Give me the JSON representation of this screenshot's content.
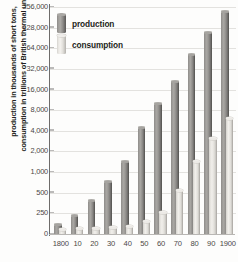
{
  "chart_data": {
    "type": "bar",
    "title": "",
    "xlabel": "",
    "ylabel": "production in thousands of short tons, consumption in trillions of British thermal units",
    "ylabel_lines": [
      "production in thousands of short tons,",
      "consumption in trillions of British thermal units"
    ],
    "yscale": "log2",
    "ylim": [
      0,
      256000
    ],
    "ytick_labels": [
      "256,000",
      "128,000",
      "64,000",
      "32,000",
      "16,000",
      "8,000",
      "4,000",
      "2,000",
      "1,000",
      "500",
      "250",
      "0"
    ],
    "ytick_values": [
      256000,
      128000,
      64000,
      32000,
      16000,
      8000,
      4000,
      2000,
      1000,
      500,
      250,
      0
    ],
    "grid": true,
    "legend_position": "top-left",
    "categories": [
      "1800",
      "10",
      "20",
      "30",
      "40",
      "50",
      "60",
      "70",
      "80",
      "90",
      "1900"
    ],
    "series": [
      {
        "name": "production",
        "color": "#8d8b88",
        "values": [
          110,
          220,
          380,
          720,
          1400,
          4400,
          10000,
          21000,
          52000,
          110000,
          220000
        ]
      },
      {
        "name": "consumption",
        "color": "#e2e0db",
        "values": [
          55,
          60,
          70,
          80,
          95,
          150,
          260,
          540,
          1400,
          3100,
          6000
        ]
      }
    ]
  },
  "legend": {
    "items": [
      {
        "label": "production",
        "key": "production"
      },
      {
        "label": "consumption",
        "key": "consumption"
      }
    ]
  }
}
